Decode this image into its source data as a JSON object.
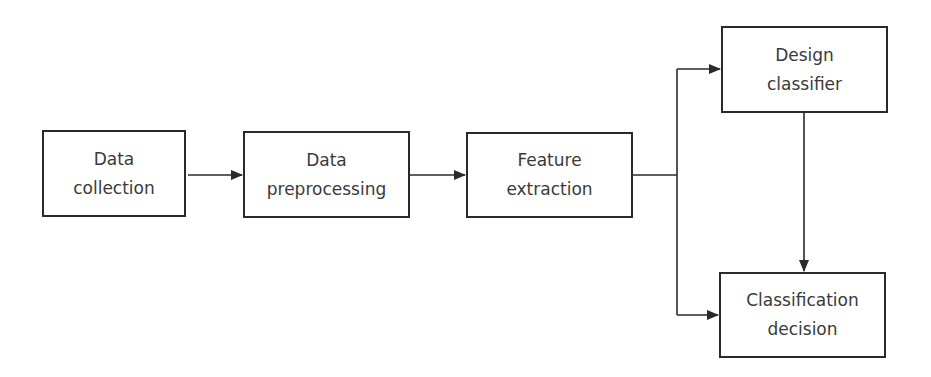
{
  "diagram": {
    "type": "flowchart",
    "colors": {
      "stroke": "#2a2a2a",
      "text": "#3a3a3a",
      "background": "#ffffff"
    },
    "nodes": [
      {
        "id": "data_collection",
        "label": "Data\ncollection"
      },
      {
        "id": "data_preprocessing",
        "label": "Data\npreprocessing"
      },
      {
        "id": "feature_extraction",
        "label": "Feature\nextraction"
      },
      {
        "id": "design_classifier",
        "label": "Design\nclassifier"
      },
      {
        "id": "classification_decision",
        "label": "Classification\ndecision"
      }
    ],
    "edges": [
      {
        "from": "data_collection",
        "to": "data_preprocessing"
      },
      {
        "from": "data_preprocessing",
        "to": "feature_extraction"
      },
      {
        "from": "feature_extraction",
        "to": "design_classifier"
      },
      {
        "from": "feature_extraction",
        "to": "classification_decision"
      },
      {
        "from": "design_classifier",
        "to": "classification_decision"
      }
    ]
  }
}
